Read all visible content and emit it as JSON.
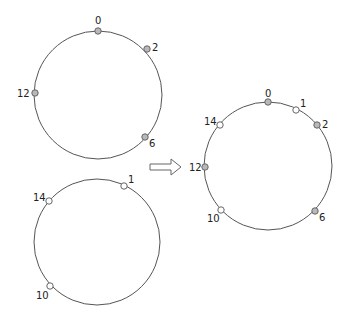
{
  "diagram": {
    "type": "consistent-hash-ring-merge",
    "colors": {
      "ring_stroke": "#555555",
      "filled_node": "#b8b8b8",
      "open_node": "#ffffff",
      "node_stroke": "#666666",
      "label": "#222222"
    },
    "rings": [
      {
        "name": "ring-a",
        "cx": 98,
        "cy": 95,
        "r": 64,
        "nodes": [
          {
            "label": "0",
            "x": 98,
            "y": 31,
            "filled": true,
            "lx": 95,
            "ly": 24
          },
          {
            "label": "2",
            "x": 147,
            "y": 49,
            "filled": true,
            "lx": 152,
            "ly": 51
          },
          {
            "label": "12",
            "x": 35,
            "y": 93,
            "filled": true,
            "lx": 17,
            "ly": 97
          },
          {
            "label": "6",
            "x": 145,
            "y": 137,
            "filled": true,
            "lx": 149,
            "ly": 147
          }
        ]
      },
      {
        "name": "ring-b",
        "cx": 97,
        "cy": 242,
        "r": 63,
        "nodes": [
          {
            "label": "1",
            "x": 124,
            "y": 186,
            "filled": false,
            "lx": 128,
            "ly": 183
          },
          {
            "label": "14",
            "x": 49,
            "y": 201,
            "filled": false,
            "lx": 33,
            "ly": 201
          },
          {
            "label": "10",
            "x": 50,
            "y": 286,
            "filled": false,
            "lx": 36,
            "ly": 299
          }
        ]
      },
      {
        "name": "ring-merged",
        "cx": 268,
        "cy": 166,
        "r": 64,
        "nodes": [
          {
            "label": "0",
            "x": 268,
            "y": 102,
            "filled": true,
            "lx": 265,
            "ly": 97
          },
          {
            "label": "1",
            "x": 296,
            "y": 110,
            "filled": false,
            "lx": 300,
            "ly": 107
          },
          {
            "label": "2",
            "x": 317,
            "y": 125,
            "filled": true,
            "lx": 322,
            "ly": 128
          },
          {
            "label": "14",
            "x": 220,
            "y": 125,
            "filled": false,
            "lx": 204,
            "ly": 125
          },
          {
            "label": "12",
            "x": 205,
            "y": 167,
            "filled": true,
            "lx": 189,
            "ly": 171
          },
          {
            "label": "10",
            "x": 221,
            "y": 210,
            "filled": false,
            "lx": 207,
            "ly": 222
          },
          {
            "label": "6",
            "x": 315,
            "y": 211,
            "filled": true,
            "lx": 319,
            "ly": 221
          }
        ]
      }
    ],
    "arrow": {
      "label": "merge-arrow",
      "x": 150,
      "y": 161,
      "w": 31,
      "h": 12
    }
  }
}
